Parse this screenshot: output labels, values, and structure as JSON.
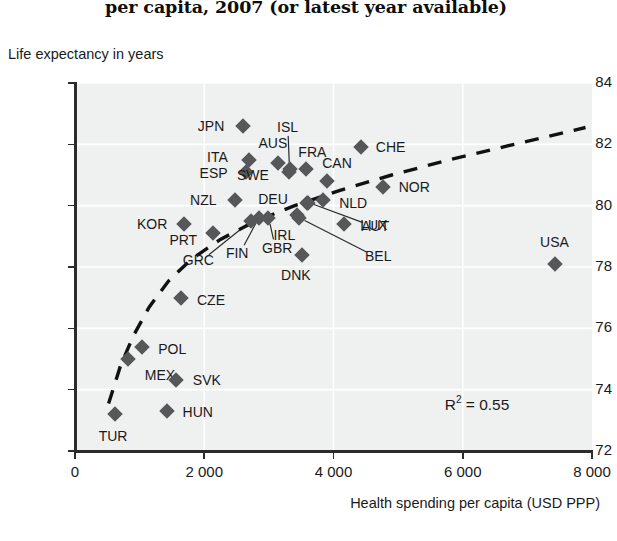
{
  "chart_data": {
    "type": "scatter",
    "title": "per capita, 2007 (or latest year available)",
    "xlabel": "Health spending per capita (USD PPP)",
    "ylabel": "Life expectancy in years",
    "xlim": [
      0,
      8000
    ],
    "ylim": [
      72,
      84
    ],
    "xticks": [
      "0",
      "2 000",
      "4 000",
      "6 000",
      "8 000"
    ],
    "xtick_values": [
      0,
      2000,
      4000,
      6000,
      8000
    ],
    "yticks": [
      "72",
      "74",
      "76",
      "78",
      "80",
      "82",
      "84"
    ],
    "ytick_values": [
      72,
      74,
      76,
      78,
      80,
      82,
      84
    ],
    "grid": true,
    "legend": "none",
    "annotation": "R2 = 0.55",
    "r2_prefix": "R",
    "r2_exponent": "2",
    "r2_value": " = 0.55",
    "trendline": {
      "style": "dashed",
      "shape": "logarithmic",
      "color": "#111111",
      "points": [
        [
          520,
          73.55
        ],
        [
          700,
          74.75
        ],
        [
          900,
          75.75
        ],
        [
          1150,
          76.7
        ],
        [
          1450,
          77.55
        ],
        [
          1800,
          78.25
        ],
        [
          2250,
          78.9
        ],
        [
          2800,
          79.5
        ],
        [
          3400,
          80.0
        ],
        [
          4100,
          80.5
        ],
        [
          4900,
          81.0
        ],
        [
          5800,
          81.5
        ],
        [
          6800,
          82.0
        ],
        [
          7900,
          82.55
        ]
      ]
    },
    "points": [
      {
        "code": "JPN",
        "x": 2600,
        "y": 82.6,
        "lx": -32,
        "ly": 0
      },
      {
        "code": "ISL",
        "x": 3320,
        "y": 81.2,
        "lx": -2,
        "ly": -42,
        "leader": true
      },
      {
        "code": "CHE",
        "x": 4420,
        "y": 81.9,
        "lx": 30,
        "ly": 0
      },
      {
        "code": "ITA",
        "x": 2700,
        "y": 81.5,
        "lx": -32,
        "ly": -3
      },
      {
        "code": "ESP",
        "x": 2640,
        "y": 81.1,
        "lx": -32,
        "ly": 1
      },
      {
        "code": "AUS",
        "x": 3140,
        "y": 81.4,
        "lx": -5,
        "ly": -20
      },
      {
        "code": "FRA",
        "x": 3580,
        "y": 81.2,
        "lx": 6,
        "ly": -17
      },
      {
        "code": "SWE",
        "x": 3310,
        "y": 81.1,
        "lx": -36,
        "ly": 3
      },
      {
        "code": "CAN",
        "x": 3900,
        "y": 80.8,
        "lx": 10,
        "ly": -18
      },
      {
        "code": "NOR",
        "x": 4770,
        "y": 80.6,
        "lx": 31,
        "ly": 0
      },
      {
        "code": "NZL",
        "x": 2480,
        "y": 80.2,
        "lx": -32,
        "ly": 0
      },
      {
        "code": "DEU",
        "x": 3590,
        "y": 80.1,
        "lx": -34,
        "ly": -4
      },
      {
        "code": "NLD",
        "x": 3840,
        "y": 80.2,
        "lx": 30,
        "ly": 3
      },
      {
        "code": "LUX",
        "x": 4160,
        "y": 79.4,
        "lx": 30,
        "ly": 1
      },
      {
        "code": "KOR",
        "x": 1690,
        "y": 79.4,
        "lx": -32,
        "ly": 0
      },
      {
        "code": "PRT",
        "x": 2140,
        "y": 79.1,
        "lx": -30,
        "ly": 7
      },
      {
        "code": "IRL",
        "x": 3440,
        "y": 79.7,
        "lx": -13,
        "ly": 20
      },
      {
        "code": "AUT",
        "x": 3610,
        "y": 80.1,
        "lx": 67,
        "ly": 23,
        "leader": true
      },
      {
        "code": "BEL",
        "x": 3470,
        "y": 79.6,
        "lx": 79,
        "ly": 38,
        "leader": true
      },
      {
        "code": "GBR",
        "x": 2990,
        "y": 79.6,
        "lx": 9,
        "ly": 30,
        "leader": true
      },
      {
        "code": "FIN",
        "x": 2850,
        "y": 79.6,
        "lx": -22,
        "ly": 35,
        "leader": true
      },
      {
        "code": "GRC",
        "x": 2730,
        "y": 79.5,
        "lx": -53,
        "ly": 39,
        "leader": true
      },
      {
        "code": "DNK",
        "x": 3510,
        "y": 78.4,
        "lx": -6,
        "ly": 20
      },
      {
        "code": "USA",
        "x": 7420,
        "y": 78.1,
        "lx": 0,
        "ly": -22
      },
      {
        "code": "CZE",
        "x": 1640,
        "y": 77.0,
        "lx": 30,
        "ly": 2
      },
      {
        "code": "POL",
        "x": 1040,
        "y": 75.4,
        "lx": 30,
        "ly": 2
      },
      {
        "code": "MEX",
        "x": 820,
        "y": 75.0,
        "lx": 32,
        "ly": 16
      },
      {
        "code": "SVK",
        "x": 1560,
        "y": 74.3,
        "lx": 31,
        "ly": 0
      },
      {
        "code": "HUN",
        "x": 1420,
        "y": 73.3,
        "lx": 31,
        "ly": 1
      },
      {
        "code": "TUR",
        "x": 620,
        "y": 73.2,
        "lx": -2,
        "ly": 22
      }
    ]
  }
}
